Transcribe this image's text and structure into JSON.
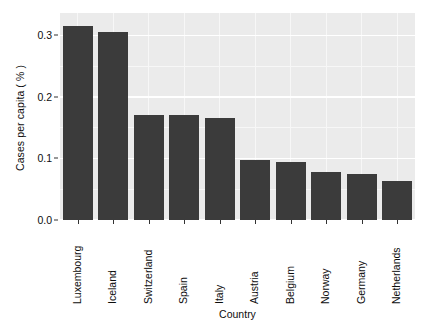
{
  "chart_data": {
    "type": "bar",
    "title": "",
    "xlabel": "Country",
    "ylabel": "Cases per capita ( % )",
    "categories": [
      "Luxembourg",
      "Iceland",
      "Switzerland",
      "Spain",
      "Italy",
      "Austria",
      "Belgium",
      "Norway",
      "Germany",
      "Netherlands"
    ],
    "values": [
      0.315,
      0.306,
      0.171,
      0.171,
      0.166,
      0.098,
      0.094,
      0.078,
      0.075,
      0.063
    ],
    "ylim": [
      0.0,
      0.3365
    ],
    "ytick_values": [
      0.0,
      0.1,
      0.2,
      0.3
    ],
    "ytick_labels": [
      "0.0",
      "0.1",
      "0.2",
      "0.3"
    ],
    "grid": true,
    "legend": false,
    "bar_color": "#3b3b3b",
    "panel_color": "#ebebeb",
    "gridline_color": "#ffffff"
  }
}
